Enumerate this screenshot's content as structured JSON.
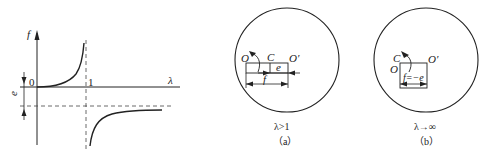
{
  "graph": {
    "y_axis_label": "f",
    "x_axis_label": "λ",
    "origin_label": "0",
    "asymptote_label": "1",
    "offset_label": "e"
  },
  "panel_a": {
    "label_O": "O",
    "label_C": "C",
    "label_Oprime": "O′",
    "label_e": "e",
    "label_f": "f",
    "condition": "λ>1",
    "caption": "（a）"
  },
  "panel_b": {
    "label_C": "C",
    "label_O": "O",
    "label_Oprime": "O′",
    "label_f": "f=−e",
    "condition": "λ→∞",
    "caption": "（b）"
  }
}
